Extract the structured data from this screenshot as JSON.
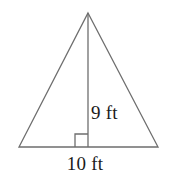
{
  "figure": {
    "type": "triangle-with-altitude",
    "background_color": "#ffffff",
    "stroke_color": "#6e6e6e",
    "text_color": "#1a1a1a",
    "labels": {
      "height": "9 ft",
      "base": "10 ft"
    },
    "measurements": {
      "height_value": 9,
      "height_unit": "ft",
      "base_value": 10,
      "base_unit": "ft"
    },
    "geometry": {
      "apex": [
        88,
        13
      ],
      "bottom_left": [
        19,
        147
      ],
      "bottom_right": [
        158,
        147
      ],
      "altitude_foot": [
        88,
        147
      ],
      "right_angle_marker": {
        "size": 13,
        "side": "left",
        "x": 75,
        "y": 134
      }
    }
  }
}
